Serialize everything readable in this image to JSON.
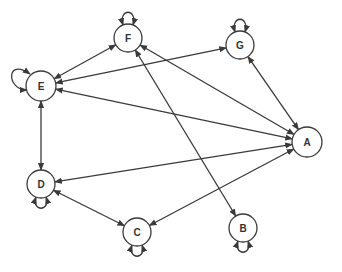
{
  "diagram": {
    "type": "directed-graph",
    "stroke_color": "#3a3a3a",
    "node_fill": "#ffffff",
    "nodes": [
      {
        "id": "F",
        "label": "F",
        "x": 128,
        "y": 38,
        "r": 14,
        "self_loop": "top"
      },
      {
        "id": "G",
        "label": "G",
        "x": 240,
        "y": 45,
        "r": 14,
        "self_loop": "top"
      },
      {
        "id": "E",
        "label": "E",
        "x": 41,
        "y": 86,
        "r": 15,
        "self_loop": "left"
      },
      {
        "id": "A",
        "label": "A",
        "x": 307,
        "y": 142,
        "r": 15,
        "self_loop": null
      },
      {
        "id": "D",
        "label": "D",
        "x": 41,
        "y": 184,
        "r": 14,
        "self_loop": "bottom"
      },
      {
        "id": "C",
        "label": "C",
        "x": 137,
        "y": 232,
        "r": 14,
        "self_loop": "bottom"
      },
      {
        "id": "B",
        "label": "B",
        "x": 243,
        "y": 228,
        "r": 14,
        "self_loop": "bottom"
      }
    ],
    "edges": [
      {
        "from": "E",
        "to": "F",
        "bidirectional": true
      },
      {
        "from": "E",
        "to": "G",
        "bidirectional": true
      },
      {
        "from": "F",
        "to": "A",
        "bidirectional": true
      },
      {
        "from": "A",
        "to": "E",
        "bidirectional": true
      },
      {
        "from": "G",
        "to": "A",
        "bidirectional": true
      },
      {
        "from": "E",
        "to": "D",
        "bidirectional": true
      },
      {
        "from": "D",
        "to": "A",
        "bidirectional": true
      },
      {
        "from": "D",
        "to": "C",
        "bidirectional": true
      },
      {
        "from": "C",
        "to": "A",
        "bidirectional": true
      },
      {
        "from": "F",
        "to": "B",
        "bidirectional": true
      }
    ]
  }
}
